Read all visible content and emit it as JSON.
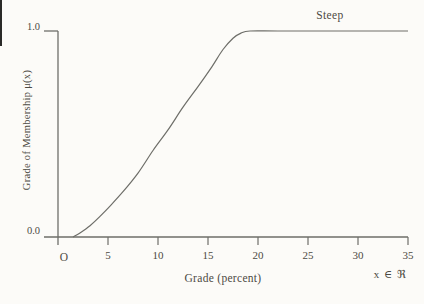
{
  "chart_data": {
    "type": "line",
    "title": "",
    "curve_label": "Steep",
    "xlabel": "Grade (percent)",
    "ylabel": "Grade of Membership μ(x)",
    "origin_label": "O",
    "annotation": "x ∈ ℜ",
    "y_tick_labels": [
      "0.0",
      "1.0"
    ],
    "x_ticks": [
      5,
      10,
      15,
      20,
      25,
      30,
      35
    ],
    "xlim": [
      0,
      35
    ],
    "ylim": [
      0,
      1
    ],
    "grid": false,
    "legend_position": "none",
    "series": [
      {
        "name": "Steep",
        "points": [
          [
            1.5,
            0
          ],
          [
            2.2,
            0.02
          ],
          [
            3.2,
            0.055
          ],
          [
            4.2,
            0.1
          ],
          [
            5.2,
            0.15
          ],
          [
            6.5,
            0.22
          ],
          [
            8,
            0.31
          ],
          [
            9.5,
            0.42
          ],
          [
            11,
            0.52
          ],
          [
            12.5,
            0.63
          ],
          [
            14,
            0.73
          ],
          [
            15.3,
            0.82
          ],
          [
            16.5,
            0.91
          ],
          [
            17.5,
            0.965
          ],
          [
            18.3,
            0.99
          ],
          [
            19.2,
            1.0
          ],
          [
            22,
            1.0
          ],
          [
            28,
            1.0
          ],
          [
            35,
            1.0
          ]
        ]
      }
    ]
  },
  "colors": {
    "line": "#6e6e69",
    "text": "#4c4a43",
    "background": "#fcfbf8"
  }
}
